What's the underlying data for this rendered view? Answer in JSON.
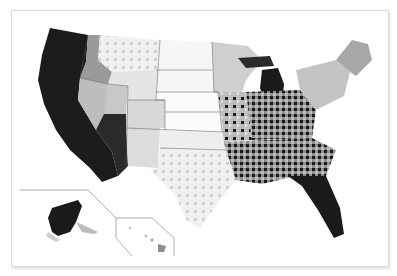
{
  "map": {
    "type": "choropleth",
    "region": "United States (counties)",
    "color_scale": {
      "palette": [
        "#ffffff",
        "#e2e2e2",
        "#bdbdbd",
        "#8f8f8f",
        "#1a1a1a"
      ],
      "description": "grayscale, light = low, black = high"
    },
    "insets": [
      "Alaska",
      "Hawaii"
    ],
    "regions": {
      "west_coast": "#1a1a1a",
      "nevada": "#bdbdbd",
      "arizona": "#8f8f8f",
      "mountain": "#e2e2e2",
      "plains": "#ffffff",
      "midwest": "#bdbdbd",
      "michigan_lower": "#1a1a1a",
      "southeast": "#3a3a3a",
      "florida": "#1a1a1a",
      "northeast": "#bdbdbd",
      "texas": "#e2e2e2",
      "alaska": "#1a1a1a",
      "hawaii": "#8f8f8f"
    }
  }
}
